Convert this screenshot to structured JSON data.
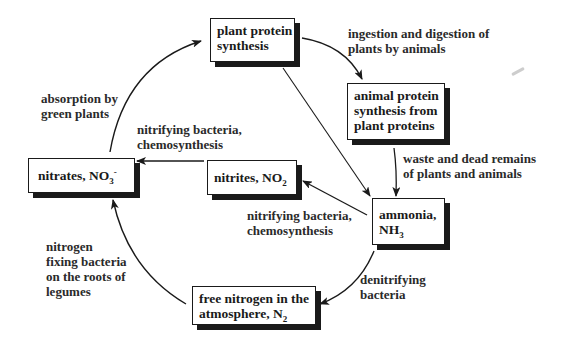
{
  "diagram": {
    "nodes": {
      "plant_protein": {
        "lines": [
          "plant protein",
          "synthesis"
        ]
      },
      "animal_protein": {
        "lines": [
          "animal protein",
          "synthesis from",
          "plant proteins"
        ]
      },
      "ammonia": {
        "line1": "ammonia,",
        "line2_base": "NH",
        "line2_sub": "3"
      },
      "nitrites": {
        "base": "nitrites, NO",
        "sub": "2"
      },
      "nitrates": {
        "base": "nitrates, NO",
        "sub": "3",
        "sup": "-"
      },
      "free_nitrogen": {
        "line1": "free nitrogen in the",
        "line2_base": "atmosphere, N",
        "line2_sub": "2"
      }
    },
    "edges": {
      "ingestion": {
        "from": "plant_protein",
        "to": "animal_protein",
        "lines": [
          "ingestion and digestion of",
          "plants by animals"
        ]
      },
      "waste": {
        "from": "animal_protein",
        "to": "ammonia",
        "lines": [
          "waste and dead remains",
          "of plants and animals"
        ]
      },
      "direct_decay": {
        "from": "plant_protein",
        "to": "ammonia",
        "lines": []
      },
      "nitrification_1": {
        "from": "ammonia",
        "to": "nitrites",
        "lines": [
          "nitrifying bacteria,",
          "chemosynthesis"
        ]
      },
      "nitrification_2": {
        "from": "nitrites",
        "to": "nitrates",
        "lines": [
          "nitrifying bacteria,",
          "chemosynthesis"
        ]
      },
      "absorption": {
        "from": "nitrates",
        "to": "plant_protein",
        "lines": [
          "absorption by",
          "green plants"
        ]
      },
      "denitrification": {
        "from": "ammonia",
        "to": "free_nitrogen",
        "lines": [
          "denitrifying",
          "bacteria"
        ]
      },
      "fixation": {
        "from": "free_nitrogen",
        "to": "nitrates",
        "lines": [
          "nitrogen",
          "fixing bacteria",
          "on the roots of",
          "legumes"
        ]
      }
    },
    "colors": {
      "ink": "#1a1a1a",
      "background": "#ffffff"
    }
  }
}
